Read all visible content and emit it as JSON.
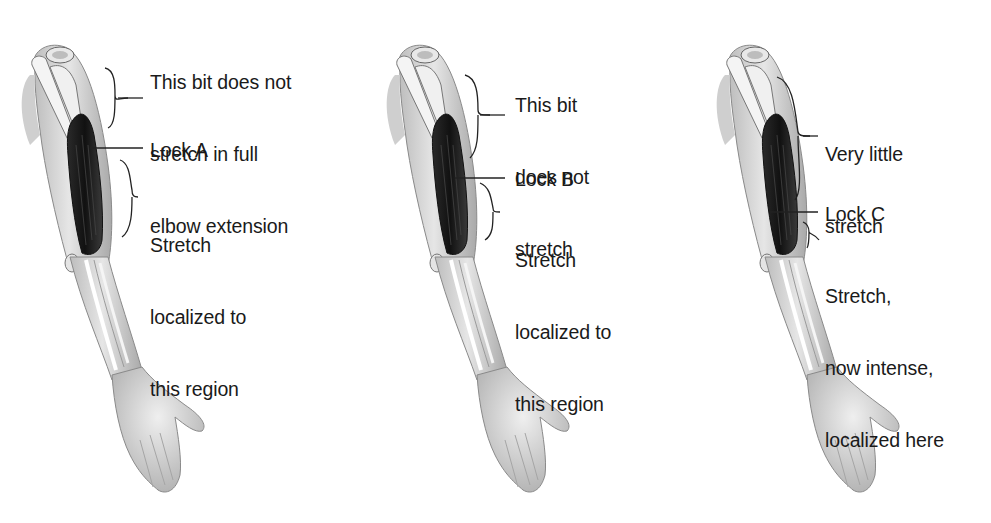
{
  "panels": [
    {
      "id": "A",
      "upper_label": [
        "This bit does not",
        "stretch in full",
        "elbow extension"
      ],
      "lock_label": "Lock A",
      "lower_label": [
        "Stretch",
        "localized to",
        "this region"
      ]
    },
    {
      "id": "B",
      "upper_label": [
        "This bit",
        "does not",
        "stretch"
      ],
      "lock_label": "Lock B",
      "lower_label": [
        "Stretch",
        "localized to",
        "this region"
      ]
    },
    {
      "id": "C",
      "upper_label": [
        "Very little",
        "stretch"
      ],
      "lock_label": "Lock C",
      "lower_label": [
        "Stretch,",
        "now intense,",
        "localized here"
      ]
    }
  ],
  "colors": {
    "text": "#1a1a1a",
    "skin": "#d8d8d8",
    "muscle": "#1e1e1e",
    "bone": "#f2f2f2"
  }
}
